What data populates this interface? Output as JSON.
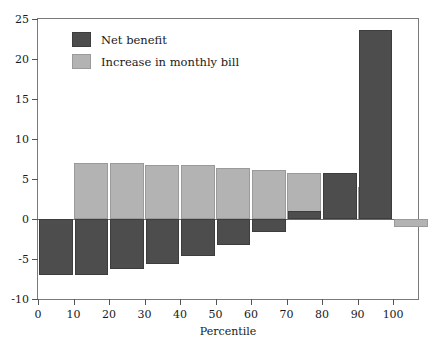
{
  "chart_data": {
    "type": "bar",
    "title": "",
    "xlabel": "Percentile",
    "ylabel": "",
    "categories": [
      10,
      20,
      30,
      40,
      50,
      60,
      70,
      80,
      90,
      100
    ],
    "series": [
      {
        "name": "Net benefit",
        "color": "#4d4d4d",
        "values": [
          -7.0,
          -7.0,
          -6.3,
          -5.6,
          -4.6,
          -3.3,
          -1.6,
          1.0,
          5.7,
          23.6
        ]
      },
      {
        "name": "Increase in monthly bill",
        "color": "#b3b3b3",
        "values": [
          7.0,
          7.0,
          6.8,
          6.7,
          6.4,
          6.1,
          5.7,
          5.1,
          4.0,
          -1.0
        ]
      }
    ],
    "xlim": [
      0,
      107
    ],
    "ylim": [
      -10,
      25
    ],
    "x_ticks": [
      0,
      10,
      20,
      30,
      40,
      50,
      60,
      70,
      80,
      90,
      100
    ],
    "x_tick_labels": [
      "0",
      "10",
      "20",
      "30",
      "40",
      "50",
      "60",
      "70",
      "80",
      "90",
      "100"
    ],
    "y_ticks": [
      -10,
      -5,
      0,
      5,
      10,
      15,
      20,
      25
    ],
    "y_tick_labels": [
      "-10",
      "-5",
      "0",
      "5",
      "10",
      "15",
      "20",
      "25"
    ],
    "grid": false,
    "legend_position": "upper-left",
    "bar_width": 9.5,
    "bar_gap": 1.5
  }
}
